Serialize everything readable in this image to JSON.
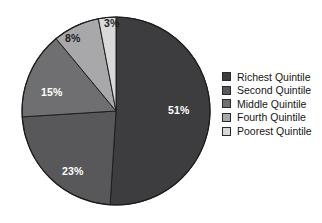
{
  "chart_data": {
    "type": "pie",
    "title": "",
    "categories": [
      "Richest Quintile",
      "Second Quintile",
      "Middle Quintile",
      "Fourth Quintile",
      "Poorest Quintile"
    ],
    "values": [
      51,
      23,
      15,
      8,
      3
    ],
    "value_labels": [
      "51%",
      "23%",
      "15%",
      "8%",
      "3%"
    ],
    "colors": [
      "#3d3d3f",
      "#58585a",
      "#6f6f71",
      "#a8a8aa",
      "#d9d9d9"
    ],
    "label_text_colors": [
      "#ffffff",
      "#ffffff",
      "#ffffff",
      "#1d1d1d",
      "#1d1d1d"
    ],
    "start_angle_deg": 0,
    "direction": "clockwise",
    "legend_position": "right",
    "grid": false
  },
  "slices": [
    {
      "label": "51%",
      "name": "Richest Quintile",
      "value": 51
    },
    {
      "label": "23%",
      "name": "Second Quintile",
      "value": 23
    },
    {
      "label": "15%",
      "name": "Middle Quintile",
      "value": 15
    },
    {
      "label": "8%",
      "name": "Fourth Quintile",
      "value": 8
    },
    {
      "label": "3%",
      "name": "Poorest Quintile",
      "value": 3
    }
  ],
  "legend": {
    "items": [
      {
        "label": "Richest Quintile",
        "color": "#3d3d3f"
      },
      {
        "label": "Second Quintile",
        "color": "#58585a"
      },
      {
        "label": "Middle Quintile",
        "color": "#6f6f71"
      },
      {
        "label": "Fourth Quintile",
        "color": "#a8a8aa"
      },
      {
        "label": "Poorest Quintile",
        "color": "#d9d9d9"
      }
    ]
  }
}
